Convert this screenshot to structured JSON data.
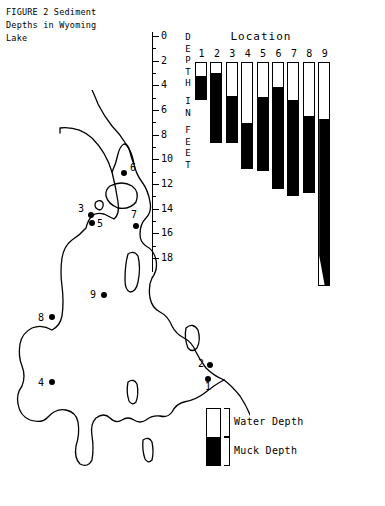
{
  "figure": {
    "caption": "FIGURE 2  Sediment\nDepths in Wyoming\nLake"
  },
  "chart": {
    "title": "Location",
    "axis_title_letters": [
      "D",
      "E",
      "P",
      "T",
      "H",
      "I",
      "N",
      "F",
      "E",
      "E",
      "T"
    ],
    "axis_title_text": "DEPTH IN FEET"
  },
  "legend": {
    "water_label": "Water Depth",
    "muck_label": "Muck Depth",
    "water_color": "#ffffff",
    "muck_color": "#000000"
  },
  "map": {
    "points": [
      {
        "id": "1",
        "label": "1",
        "x": 208,
        "y": 289,
        "label_x": 205,
        "label_y": 300
      },
      {
        "id": "2",
        "label": "2",
        "x": 210,
        "y": 275,
        "label_x": 198,
        "label_y": 277
      },
      {
        "id": "3",
        "label": "3",
        "x": 91,
        "y": 125,
        "label_x": 78,
        "label_y": 122
      },
      {
        "id": "4",
        "label": "4",
        "x": 52,
        "y": 292,
        "label_x": 38,
        "label_y": 296
      },
      {
        "id": "5",
        "label": "5",
        "x": 92,
        "y": 133,
        "label_x": 97,
        "label_y": 137
      },
      {
        "id": "6",
        "label": "6",
        "x": 124,
        "y": 83,
        "label_x": 130,
        "label_y": 81
      },
      {
        "id": "7",
        "label": "7",
        "x": 136,
        "y": 136,
        "label_x": 131,
        "label_y": 128
      },
      {
        "id": "8",
        "label": "8",
        "x": 52,
        "y": 227,
        "label_x": 38,
        "label_y": 231
      },
      {
        "id": "9",
        "label": "9",
        "x": 104,
        "y": 205,
        "label_x": 90,
        "label_y": 208
      }
    ]
  },
  "chart_data": {
    "type": "bar",
    "title": "Location",
    "subtitle": "FIGURE 2  Sediment Depths in Wyoming Lake",
    "xlabel": "Location",
    "ylabel": "DEPTH IN FEET",
    "ylim": [
      0,
      18
    ],
    "y_inverted": true,
    "y_ticks": [
      0,
      2,
      4,
      6,
      8,
      10,
      12,
      14,
      16,
      18
    ],
    "y_minor_tick_step": 1,
    "grid": false,
    "legend_position": "bottom-right",
    "stacked": true,
    "categories": [
      "1",
      "2",
      "3",
      "4",
      "5",
      "6",
      "7",
      "8",
      "9"
    ],
    "series": [
      {
        "name": "Water Depth",
        "color": "#ffffff",
        "values": [
          1.2,
          1.0,
          2.8,
          5.0,
          2.9,
          2.1,
          3.2,
          4.5,
          4.7
        ]
      },
      {
        "name": "Muck Depth",
        "color": "#000000",
        "values": [
          1.9,
          5.6,
          3.8,
          3.7,
          5.9,
          8.2,
          7.7,
          6.1,
          13.5
        ]
      }
    ],
    "totals": [
      3.1,
      6.6,
      6.6,
      8.7,
      8.8,
      10.3,
      10.9,
      10.6,
      18.2
    ]
  }
}
